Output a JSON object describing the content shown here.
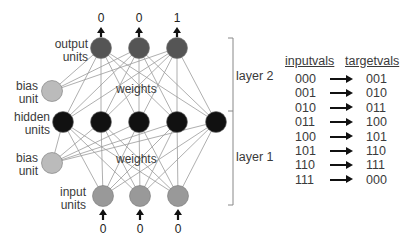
{
  "network": {
    "output_values": [
      "0",
      "0",
      "1"
    ],
    "input_values": [
      "0",
      "0",
      "0"
    ],
    "labels": {
      "output_units": "output units",
      "hidden_units": "hidden units",
      "input_units": "input units",
      "bias_unit_top": "bias unit",
      "bias_unit_bottom": "bias unit",
      "weights_top": "weights",
      "weights_bottom": "weights",
      "layer2": "layer 2",
      "layer1": "layer 1"
    },
    "layer_sizes": {
      "input": 3,
      "hidden": 5,
      "output": 3
    },
    "colors": {
      "output": "#555555",
      "hidden": "#111111",
      "input": "#999999",
      "bias": "#bbbbbb",
      "edge": "#9a9a9a"
    }
  },
  "table": {
    "headers": [
      "inputvals",
      "targetvals"
    ],
    "rows": [
      {
        "input": "000",
        "target": "001"
      },
      {
        "input": "001",
        "target": "010"
      },
      {
        "input": "010",
        "target": "011"
      },
      {
        "input": "011",
        "target": "100"
      },
      {
        "input": "100",
        "target": "101"
      },
      {
        "input": "101",
        "target": "110"
      },
      {
        "input": "110",
        "target": "111"
      },
      {
        "input": "111",
        "target": "000"
      }
    ]
  }
}
